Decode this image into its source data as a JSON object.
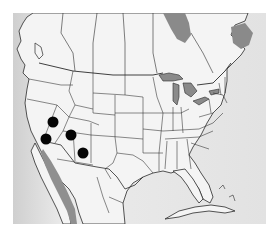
{
  "map": {
    "region": "North America (United States, southern Canada, northern Mexico)",
    "style": "grayscale political outline map with state/province borders",
    "colors": {
      "land": "#f4f4f4",
      "water": "#d9d9d9",
      "lakes": "#8a8a8a",
      "borders": "#2a2a2a",
      "marker": "#050505"
    },
    "markers": [
      {
        "id": "marker-1",
        "x": 53,
        "y": 122
      },
      {
        "id": "marker-2",
        "x": 46,
        "y": 139
      },
      {
        "id": "marker-3",
        "x": 71,
        "y": 135
      },
      {
        "id": "marker-4",
        "x": 83,
        "y": 153
      }
    ]
  }
}
